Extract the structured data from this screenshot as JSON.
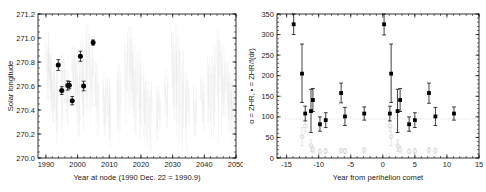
{
  "figure": {
    "name": "two-panel-meteor-shower-scatter",
    "background_color": "#ffffff",
    "marker_color": "#000000",
    "faint_color": "#d6d6d6"
  },
  "panels": [
    {
      "id": "left",
      "xlabel": "Year at node (1990 Dec. 22 = 1990.9)",
      "ylabel": "Solar longitude",
      "xticks": [
        "1990",
        "2000",
        "2010",
        "2020",
        "2030",
        "2040",
        "2050"
      ],
      "xtick_values": [
        1990,
        2000,
        2010,
        2020,
        2030,
        2040,
        2050
      ],
      "yticks": [
        "270.0",
        "270.2",
        "270.4",
        "270.6",
        "270.8",
        "271.0",
        "271.2"
      ],
      "ytick_values": [
        270.0,
        270.2,
        270.4,
        270.6,
        270.8,
        271.0,
        271.2
      ],
      "xlim": [
        1987.5,
        2050
      ],
      "ylim": [
        270.0,
        271.2
      ]
    },
    {
      "id": "right",
      "xlabel": "Year from perihelion comet",
      "ylabel": "o = ZHR,  ▪ = ZHR/f(dr)",
      "xticks": [
        "-15",
        "-10",
        "-5",
        "0",
        "5",
        "10",
        "15"
      ],
      "xtick_values": [
        -15,
        -10,
        -5,
        0,
        5,
        10,
        15
      ],
      "yticks": [
        "0",
        "50",
        "100",
        "150",
        "200",
        "250",
        "300",
        "350"
      ],
      "ytick_values": [
        0,
        50,
        100,
        150,
        200,
        250,
        300,
        350
      ],
      "xlim": [
        -16.5,
        15
      ],
      "ylim": [
        0,
        350
      ],
      "reference_line_y": 95
    }
  ],
  "chart_data": [
    {
      "type": "scatter",
      "panel": "left",
      "title": "",
      "xlabel": "Year at node (1990 Dec. 22 = 1990.9)",
      "ylabel": "Solar longitude",
      "xlim": [
        1987.5,
        2050
      ],
      "ylim": [
        270.0,
        271.2
      ],
      "grid": false,
      "legend": "none",
      "series": [
        {
          "name": "observed nodes",
          "marker": "filled-circle",
          "color": "#000000",
          "points": [
            {
              "x": 1993.9,
              "y": 270.775,
              "yerr": 0.045
            },
            {
              "x": 1995.0,
              "y": 270.562,
              "yerr": 0.032
            },
            {
              "x": 1996.9,
              "y": 270.604,
              "yerr": 0.038
            },
            {
              "x": 1997.4,
              "y": 270.607,
              "yerr": 0.03
            },
            {
              "x": 1998.3,
              "y": 270.478,
              "yerr": 0.035
            },
            {
              "x": 2000.9,
              "y": 270.848,
              "yerr": 0.042
            },
            {
              "x": 2001.9,
              "y": 270.6,
              "yerr": 0.04
            },
            {
              "x": 2004.9,
              "y": 270.962,
              "yerr": 0.022
            }
          ]
        },
        {
          "name": "model dust trail encounters",
          "marker": "faint-streaks",
          "color": "#e2e2e2",
          "streak_clusters": [
            {
              "x": 1990.5,
              "ytop": 271.05,
              "ybot": 270.42
            },
            {
              "x": 1991.2,
              "ytop": 270.92,
              "ybot": 270.5
            },
            {
              "x": 1992.0,
              "ytop": 270.84,
              "ybot": 270.36
            },
            {
              "x": 1993.3,
              "ytop": 270.79,
              "ybot": 270.24
            },
            {
              "x": 1995.4,
              "ytop": 270.88,
              "ybot": 270.31
            },
            {
              "x": 1996.6,
              "ytop": 270.74,
              "ybot": 270.18
            },
            {
              "x": 1998.8,
              "ytop": 270.93,
              "ybot": 270.41
            },
            {
              "x": 2000.2,
              "ytop": 270.87,
              "ybot": 270.22
            },
            {
              "x": 2001.6,
              "ytop": 270.98,
              "ybot": 270.35
            },
            {
              "x": 2003.1,
              "ytop": 271.12,
              "ybot": 270.47
            },
            {
              "x": 2004.4,
              "ytop": 271.02,
              "ybot": 270.28
            },
            {
              "x": 2006.0,
              "ytop": 270.8,
              "ybot": 270.12
            },
            {
              "x": 2008.5,
              "ytop": 270.72,
              "ybot": 270.2
            },
            {
              "x": 2010.0,
              "ytop": 270.66,
              "ybot": 270.14
            },
            {
              "x": 2013.0,
              "ytop": 270.78,
              "ybot": 270.26
            },
            {
              "x": 2015.4,
              "ytop": 271.04,
              "ybot": 270.38
            },
            {
              "x": 2016.8,
              "ytop": 271.1,
              "ybot": 270.3
            },
            {
              "x": 2018.0,
              "ytop": 270.95,
              "ybot": 270.17
            },
            {
              "x": 2019.6,
              "ytop": 270.88,
              "ybot": 270.22
            },
            {
              "x": 2021.3,
              "ytop": 270.7,
              "ybot": 270.19
            },
            {
              "x": 2023.0,
              "ytop": 270.64,
              "ybot": 270.13
            },
            {
              "x": 2025.5,
              "ytop": 270.6,
              "ybot": 270.16
            },
            {
              "x": 2028.0,
              "ytop": 270.74,
              "ybot": 270.21
            },
            {
              "x": 2030.2,
              "ytop": 271.06,
              "ybot": 270.33
            },
            {
              "x": 2031.5,
              "ytop": 271.12,
              "ybot": 270.25
            },
            {
              "x": 2033.0,
              "ytop": 270.9,
              "ybot": 270.18
            },
            {
              "x": 2034.5,
              "ytop": 270.72,
              "ybot": 270.15
            },
            {
              "x": 2037.0,
              "ytop": 270.62,
              "ybot": 270.12
            },
            {
              "x": 2039.5,
              "ytop": 270.68,
              "ybot": 270.2
            },
            {
              "x": 2041.5,
              "ytop": 270.86,
              "ybot": 270.24
            },
            {
              "x": 2043.0,
              "ytop": 270.94,
              "ybot": 270.29
            },
            {
              "x": 2044.6,
              "ytop": 271.08,
              "ybot": 270.34
            },
            {
              "x": 2046.0,
              "ytop": 270.96,
              "ybot": 270.22
            },
            {
              "x": 2047.5,
              "ytop": 270.8,
              "ybot": 270.16
            },
            {
              "x": 2048.8,
              "ytop": 270.7,
              "ybot": 270.13
            }
          ]
        }
      ]
    },
    {
      "type": "scatter",
      "panel": "right",
      "title": "",
      "xlabel": "Year from perihelion comet",
      "ylabel": "o = ZHR,  ▪ = ZHR/f(dr)",
      "xlim": [
        -16.5,
        15
      ],
      "ylim": [
        0,
        350
      ],
      "grid": false,
      "legend": "in-axis-label",
      "reference_line_y": 95,
      "series": [
        {
          "name": "ZHR/f(dr)",
          "marker": "filled-square",
          "color": "#000000",
          "points": [
            {
              "x": -13.9,
              "y": 325,
              "yerr_lo": 25,
              "yerr_hi": 25
            },
            {
              "x": -12.6,
              "y": 205,
              "yerr_lo": 70,
              "yerr_hi": 72
            },
            {
              "x": -12.1,
              "y": 108,
              "yerr_lo": 18,
              "yerr_hi": 18
            },
            {
              "x": -11.2,
              "y": 114,
              "yerr_lo": 52,
              "yerr_hi": 53
            },
            {
              "x": -10.9,
              "y": 141,
              "yerr_lo": 28,
              "yerr_hi": 28
            },
            {
              "x": -9.8,
              "y": 82,
              "yerr_lo": 17,
              "yerr_hi": 18
            },
            {
              "x": -8.9,
              "y": 92,
              "yerr_lo": 18,
              "yerr_hi": 18
            },
            {
              "x": -6.5,
              "y": 158,
              "yerr_lo": 24,
              "yerr_hi": 24
            },
            {
              "x": -5.9,
              "y": 101,
              "yerr_lo": 22,
              "yerr_hi": 22
            },
            {
              "x": -2.9,
              "y": 108,
              "yerr_lo": 16,
              "yerr_hi": 16
            },
            {
              "x": 0.2,
              "y": 325,
              "yerr_lo": 26,
              "yerr_hi": 26
            },
            {
              "x": 1.3,
              "y": 205,
              "yerr_lo": 70,
              "yerr_hi": 72
            },
            {
              "x": 1.1,
              "y": 108,
              "yerr_lo": 18,
              "yerr_hi": 18
            },
            {
              "x": 2.3,
              "y": 114,
              "yerr_lo": 52,
              "yerr_hi": 53
            },
            {
              "x": 2.7,
              "y": 141,
              "yerr_lo": 28,
              "yerr_hi": 28
            },
            {
              "x": 4.1,
              "y": 82,
              "yerr_lo": 17,
              "yerr_hi": 18
            },
            {
              "x": 5.0,
              "y": 92,
              "yerr_lo": 18,
              "yerr_hi": 18
            },
            {
              "x": 7.2,
              "y": 158,
              "yerr_lo": 25,
              "yerr_hi": 24
            },
            {
              "x": 8.2,
              "y": 101,
              "yerr_lo": 22,
              "yerr_hi": 22
            },
            {
              "x": 11.1,
              "y": 108,
              "yerr_lo": 16,
              "yerr_hi": 16
            }
          ]
        },
        {
          "name": "ZHR",
          "marker": "open-circle",
          "color": "#d0d0d0",
          "points": [
            {
              "x": -12.6,
              "y": 52,
              "yerr_lo": 22,
              "yerr_hi": 22
            },
            {
              "x": -12.1,
              "y": 78,
              "yerr_lo": 14,
              "yerr_hi": 14
            },
            {
              "x": -11.2,
              "y": 30,
              "yerr_lo": 14,
              "yerr_hi": 14
            },
            {
              "x": -10.9,
              "y": 20,
              "yerr_lo": 8,
              "yerr_hi": 8
            },
            {
              "x": -9.8,
              "y": 16,
              "yerr_lo": 6,
              "yerr_hi": 6
            },
            {
              "x": -8.9,
              "y": 17,
              "yerr_lo": 6,
              "yerr_hi": 6
            },
            {
              "x": -6.5,
              "y": 18,
              "yerr_lo": 6,
              "yerr_hi": 6
            },
            {
              "x": -5.9,
              "y": 17,
              "yerr_lo": 6,
              "yerr_hi": 6
            },
            {
              "x": -2.9,
              "y": 19,
              "yerr_lo": 6,
              "yerr_hi": 6
            },
            {
              "x": 1.1,
              "y": 78,
              "yerr_lo": 14,
              "yerr_hi": 14
            },
            {
              "x": 1.3,
              "y": 52,
              "yerr_lo": 22,
              "yerr_hi": 22
            },
            {
              "x": 2.3,
              "y": 30,
              "yerr_lo": 14,
              "yerr_hi": 14
            },
            {
              "x": 2.7,
              "y": 20,
              "yerr_lo": 8,
              "yerr_hi": 8
            },
            {
              "x": 4.1,
              "y": 16,
              "yerr_lo": 6,
              "yerr_hi": 6
            },
            {
              "x": 5.0,
              "y": 17,
              "yerr_lo": 6,
              "yerr_hi": 6
            },
            {
              "x": 7.2,
              "y": 19,
              "yerr_lo": 6,
              "yerr_hi": 6
            },
            {
              "x": 8.2,
              "y": 18,
              "yerr_lo": 6,
              "yerr_hi": 6
            }
          ]
        }
      ]
    }
  ]
}
